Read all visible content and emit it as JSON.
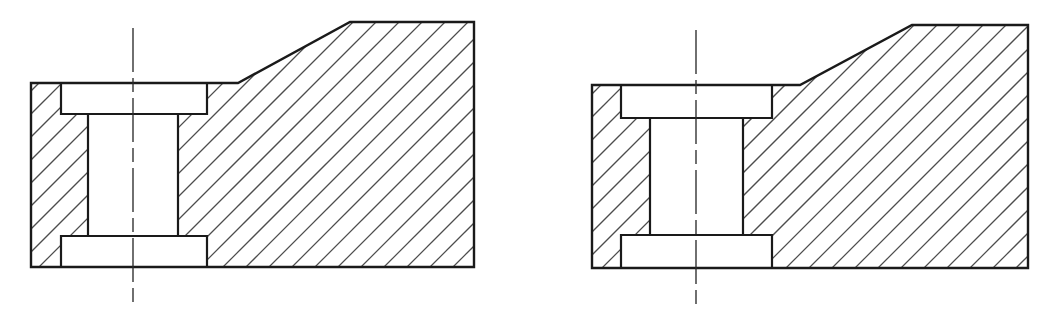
{
  "sheet": {
    "title": "Mechanical Sectional Views",
    "description": "Two engineering cross-section (full section) views of a counterbored stepped block with an inclined top face",
    "background_color": "#ffffff",
    "width": 1045,
    "height": 313,
    "line_color": "#1a1a1a",
    "hatch_color": "#4d4d4d",
    "centerline_color": "#2b2b2b",
    "view_count": 2
  },
  "views": [
    {
      "id": "left-view",
      "name": "left-sectional-view",
      "label": "Sectional view A",
      "body": {
        "name": "section-body-outline",
        "points": "31,83 238,83 350,22 474,22 474,267 31,267",
        "left": 31,
        "right": 474,
        "top_flat": 83,
        "top_apex": 22,
        "bottom": 267,
        "slope_start_x": 238,
        "slope_end_x": 350
      },
      "top_counterbore": {
        "name": "top-counterbore-cavity",
        "x1": 61,
        "y1": 83,
        "x2": 207,
        "y2": 114,
        "width": 146,
        "height": 31
      },
      "through_hole": {
        "name": "through-hole-cavity",
        "x1": 88,
        "y1": 114,
        "x2": 178,
        "y2": 236,
        "width": 90,
        "height": 122
      },
      "bottom_counterbore": {
        "name": "bottom-counterbore-cavity",
        "x1": 61,
        "y1": 236,
        "x2": 207,
        "y2": 267,
        "width": 146,
        "height": 31
      },
      "centerline": {
        "name": "vertical-centerline",
        "x": 133,
        "y1": 28,
        "y2": 305
      },
      "hatching": {
        "name": "section-hatching",
        "angle_deg": 45,
        "direction": "up-right",
        "spacing": 23
      }
    },
    {
      "id": "right-view",
      "name": "right-sectional-view",
      "label": "Sectional view B",
      "body": {
        "name": "section-body-outline",
        "points": "592,85 800,85 912,25 1028,25 1028,268 592,268",
        "left": 592,
        "right": 1028,
        "top_flat": 85,
        "top_apex": 25,
        "bottom": 268,
        "slope_start_x": 800,
        "slope_end_x": 912
      },
      "top_counterbore": {
        "name": "top-counterbore-cavity",
        "x1": 621,
        "y1": 85,
        "x2": 772,
        "y2": 118,
        "width": 151,
        "height": 33
      },
      "through_hole": {
        "name": "through-hole-cavity",
        "x1": 650,
        "y1": 118,
        "x2": 743,
        "y2": 235,
        "width": 93,
        "height": 117
      },
      "bottom_counterbore": {
        "name": "bottom-counterbore-cavity",
        "x1": 621,
        "y1": 235,
        "x2": 772,
        "y2": 268,
        "width": 151,
        "height": 33
      },
      "centerline": {
        "name": "vertical-centerline",
        "x": 696,
        "y1": 30,
        "y2": 307
      },
      "hatching": {
        "name": "section-hatching",
        "angle_deg": 45,
        "direction": "up-right",
        "spacing": 23
      }
    }
  ]
}
